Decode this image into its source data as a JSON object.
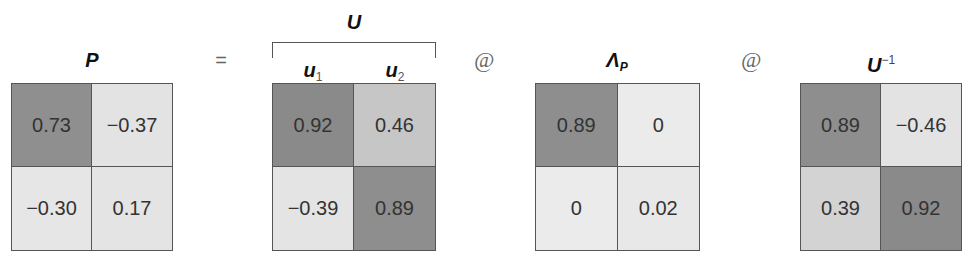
{
  "equation": {
    "operators": {
      "equals": "=",
      "matmul_1": "@",
      "matmul_2": "@"
    },
    "matrices": [
      {
        "id": "P",
        "title": "P",
        "cells": [
          "0.73",
          "−0.37",
          "−0.30",
          "0.17"
        ],
        "colors": [
          "#8f8f8f",
          "#e3e3e3",
          "#e6e6e6",
          "#e4e4e4"
        ]
      },
      {
        "id": "U",
        "title": "U",
        "column_labels": [
          {
            "base": "u",
            "index": "1"
          },
          {
            "base": "u",
            "index": "2"
          }
        ],
        "cells": [
          "0.92",
          "0.46",
          "−0.39",
          "0.89"
        ],
        "colors": [
          "#8a8a8a",
          "#c6c6c6",
          "#e4e4e4",
          "#8e8e8e"
        ]
      },
      {
        "id": "Lambda_P",
        "title": "Λ",
        "title_subscript": "P",
        "cells": [
          "0.89",
          "0",
          "0",
          "0.02"
        ],
        "colors": [
          "#8e8e8e",
          "#ebebeb",
          "#ebebeb",
          "#e8e8e8"
        ]
      },
      {
        "id": "U_inv",
        "title": "U",
        "title_superscript": "−1",
        "cells": [
          "0.89",
          "−0.46",
          "0.39",
          "0.92"
        ],
        "colors": [
          "#8e8e8e",
          "#e3e3e3",
          "#d3d3d3",
          "#8a8a8a"
        ]
      }
    ]
  }
}
